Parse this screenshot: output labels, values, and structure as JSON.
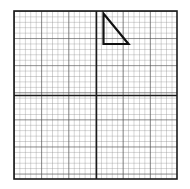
{
  "page": {
    "background_color": "#ffffff",
    "width": 190,
    "height": 189
  },
  "figure": {
    "name": "grid-with-right-triangle",
    "caption": "",
    "grid": {
      "left": 14,
      "top": 11,
      "right": 177,
      "bottom": 179,
      "minor_cell_px": 5.43,
      "minor_columns": 30,
      "minor_rows": 31,
      "minor_color": "#8a8a8a",
      "minor_width": 0.7,
      "major_every": 5,
      "major_color": "#4a4a4a",
      "major_width": 1.1,
      "border_color": "#1a1a1a",
      "border_width": 1.6,
      "axis_color": "#1a1a1a",
      "axis_width": 1.5,
      "axis_x_px": 96.5,
      "axis_y_px": 95.5
    },
    "shape": {
      "type": "right-triangle",
      "stroke_color": "#111111",
      "stroke_width": 2.2,
      "fill": "none",
      "vertices_px": [
        {
          "label": "apex",
          "x": 103.5,
          "y": 13.5
        },
        {
          "label": "right-angle",
          "x": 103.5,
          "y": 44.0
        },
        {
          "label": "base-right",
          "x": 128.5,
          "y": 44.0
        }
      ],
      "vertices_grid_units": [
        {
          "label": "apex",
          "x": 1,
          "y": 15
        },
        {
          "label": "right-angle",
          "x": 1,
          "y": 9.5
        },
        {
          "label": "base-right",
          "x": 6,
          "y": 9.5
        }
      ],
      "legs": {
        "vertical_cells": 5.5,
        "horizontal_cells": 5
      }
    }
  },
  "chart_data": {
    "type": "line",
    "title": "",
    "xlabel": "",
    "ylabel": "",
    "grid": true,
    "legend": "none",
    "xlim": [
      -15,
      15
    ],
    "ylim": [
      -15.5,
      15.5
    ],
    "series": [
      {
        "name": "right-triangle",
        "closed": true,
        "x": [
          1,
          1,
          6,
          1
        ],
        "y": [
          15,
          9.5,
          9.5,
          15
        ]
      }
    ],
    "xticks": [
      -15,
      -10,
      -5,
      0,
      5,
      10,
      15
    ],
    "yticks": [
      -15,
      -10,
      -5,
      0,
      5,
      10,
      15
    ]
  }
}
